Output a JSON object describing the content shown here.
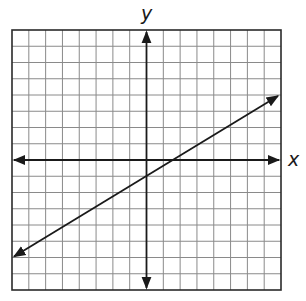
{
  "graph": {
    "x_axis_label": "x",
    "y_axis_label": "y",
    "grid": {
      "columns": 16,
      "rows": 16,
      "x_range": [
        -8,
        8
      ],
      "y_range": [
        -8,
        8
      ]
    },
    "line": {
      "start": [
        -8,
        -6
      ],
      "end": [
        8,
        4
      ],
      "y_intercept": -1,
      "x_intercept": 1.6,
      "arrows_both_ends": true
    },
    "colors": {
      "grid": "#8a8a8a",
      "axis": "#1a1a1a",
      "line": "#1a1a1a",
      "border": "#2a2a2a"
    }
  }
}
